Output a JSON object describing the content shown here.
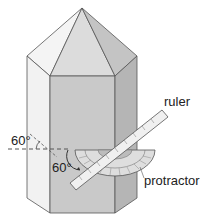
{
  "diagram": {
    "labels": {
      "ruler": "ruler",
      "protractor": "protractor",
      "angle_outer": "60°",
      "angle_inner": "60°"
    },
    "colors": {
      "left_face": "#f2f2f2",
      "front_face": "#c9c9c9",
      "right_face": "#b5b5b5",
      "top_front": "#dcdcdc",
      "top_left": "#f4f4f4",
      "top_right": "#c4c4c4",
      "edge": "#555555",
      "protractor": "#dedede",
      "ruler": "#f0f0f0"
    }
  }
}
